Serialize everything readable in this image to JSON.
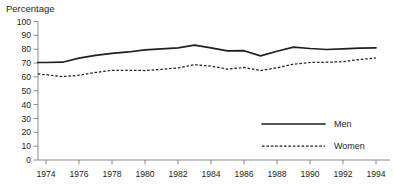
{
  "chart_data": {
    "type": "line",
    "title": "",
    "ylabel": "Percentage",
    "xlabel": "",
    "ylim": [
      0,
      100
    ],
    "ytick_values": [
      0,
      10,
      20,
      30,
      40,
      50,
      60,
      70,
      80,
      90,
      100
    ],
    "ytick_labels": [
      "0",
      "10",
      "20",
      "30",
      "40",
      "50",
      "60",
      "70",
      "80",
      "90",
      "100"
    ],
    "xlim": [
      1973.5,
      1994.5
    ],
    "xtick_values": [
      1974,
      1976,
      1978,
      1980,
      1982,
      1984,
      1986,
      1988,
      1990,
      1992,
      1994
    ],
    "xtick_labels": [
      "1974",
      "1976",
      "1978",
      "1980",
      "1982",
      "1984",
      "1986",
      "1988",
      "1990",
      "1992",
      "1994"
    ],
    "x": [
      1973.5,
      1974,
      1975,
      1976,
      1977,
      1978,
      1979,
      1980,
      1981,
      1982,
      1983,
      1984,
      1985,
      1986,
      1987,
      1988,
      1989,
      1990,
      1991,
      1992,
      1993,
      1994
    ],
    "grid": false,
    "legend_position": "bottom-right",
    "series": [
      {
        "name": "Men",
        "style": "solid",
        "color": "#231f20",
        "values": [
          70.4,
          70.4,
          70.6,
          73.5,
          75.5,
          77.0,
          78.0,
          79.5,
          80.2,
          81.0,
          83.0,
          81.0,
          78.8,
          78.9,
          75.2,
          78.5,
          81.5,
          80.5,
          79.8,
          80.2,
          80.8,
          81.0
        ]
      },
      {
        "name": "Women",
        "style": "dashed",
        "color": "#231f20",
        "values": [
          62.2,
          61.6,
          60.2,
          61.2,
          63.2,
          64.8,
          64.8,
          64.6,
          65.5,
          66.5,
          68.8,
          67.8,
          65.6,
          66.8,
          64.6,
          66.6,
          69.2,
          70.4,
          70.6,
          71.0,
          72.6,
          73.6
        ]
      }
    ],
    "legend": [
      {
        "label": "Men",
        "style": "solid"
      },
      {
        "label": "Women",
        "style": "dashed"
      }
    ]
  }
}
